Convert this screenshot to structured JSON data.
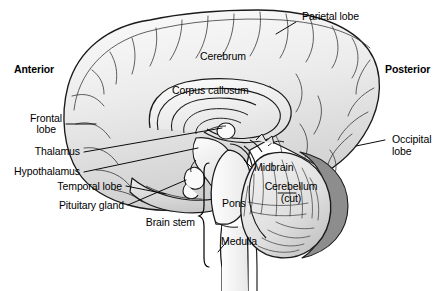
{
  "figure": {
    "background_color": "#ffffff",
    "outline_color": "#1a1a1a",
    "tissue_light": "#f2f2f2",
    "tissue_mid": "#d8d8d8",
    "tissue_dark": "#9a9a9a",
    "cerebellum_shadow": "#8d8d8d"
  },
  "orientation": {
    "anterior": "Anterior",
    "posterior": "Posterior"
  },
  "labels": {
    "parietal_lobe": "Parietal lobe",
    "cerebrum": "Cerebrum",
    "corpus_callosum": "Corpus callosum",
    "frontal_lobe_line1": "Frontal",
    "frontal_lobe_line2": "lobe",
    "thalamus": "Thalamus",
    "hypothalamus": "Hypothalamus",
    "temporal_lobe": "Temporal lobe",
    "pituitary_gland": "Pituitary gland",
    "brain_stem": "Brain stem",
    "midbrain": "Midbrain",
    "pons": "Pons",
    "medulla": "Medulla",
    "cerebellum_line1": "Cerebellum",
    "cerebellum_line2": "(cut)",
    "occipital_lobe_line1": "Occipital",
    "occipital_lobe_line2": "lobe"
  }
}
